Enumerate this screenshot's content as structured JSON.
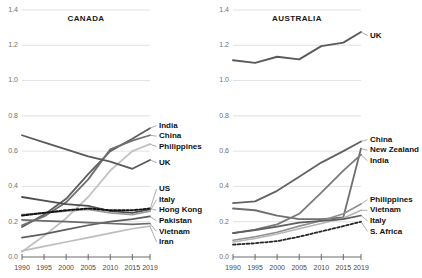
{
  "chart_data": [
    {
      "type": "line",
      "title": "CANADA",
      "xlabel": "",
      "ylabel": "",
      "x": [
        1990,
        1995,
        2000,
        2005,
        2010,
        2015,
        2019
      ],
      "xlim": [
        1990,
        2019
      ],
      "ylim": [
        0.0,
        1.4
      ],
      "xticks": [
        "1990",
        "1995",
        "2000",
        "2005",
        "2010",
        "2015",
        "2019"
      ],
      "yticks": [
        "0.0",
        "0.2",
        "0.4",
        "0.6",
        "0.8",
        "1.0",
        "1.2",
        "1.4"
      ],
      "grid": true,
      "legend_position": "right-inline-labels",
      "series": [
        {
          "name": "India",
          "values": [
            0.17,
            0.24,
            0.33,
            0.47,
            0.6,
            0.67,
            0.73
          ],
          "color": "#5e5e5e",
          "width": 1.8,
          "dash": "none"
        },
        {
          "name": "China",
          "values": [
            0.18,
            0.23,
            0.31,
            0.44,
            0.61,
            0.66,
            0.69
          ],
          "color": "#6f6f6f",
          "width": 1.8,
          "dash": "none"
        },
        {
          "name": "Philippines",
          "values": [
            0.03,
            0.12,
            0.22,
            0.34,
            0.49,
            0.6,
            0.64
          ],
          "color": "#c2c2c2",
          "width": 1.8,
          "dash": "none"
        },
        {
          "name": "UK",
          "values": [
            0.69,
            0.65,
            0.61,
            0.57,
            0.54,
            0.5,
            0.55
          ],
          "color": "#5a5a5a",
          "width": 1.8,
          "dash": "none"
        },
        {
          "name": "US",
          "values": [
            0.34,
            0.32,
            0.3,
            0.29,
            0.26,
            0.25,
            0.27
          ],
          "color": "#4f4f4f",
          "width": 1.8,
          "dash": "none"
        },
        {
          "name": "Italy",
          "values": [
            0.24,
            0.25,
            0.26,
            0.27,
            0.25,
            0.24,
            0.26
          ],
          "color": "#9a9a9a",
          "width": 1.6,
          "dash": "none"
        },
        {
          "name": "Hong Kong",
          "values": [
            0.235,
            0.25,
            0.265,
            0.275,
            0.265,
            0.265,
            0.275
          ],
          "color": "#111111",
          "width": 1.9,
          "dash": "2.4,1.8"
        },
        {
          "name": "Pakistan",
          "values": [
            0.11,
            0.13,
            0.155,
            0.18,
            0.2,
            0.215,
            0.23
          ],
          "color": "#5e5e5e",
          "width": 1.7,
          "dash": "none"
        },
        {
          "name": "Vietnam",
          "values": [
            0.21,
            0.205,
            0.2,
            0.195,
            0.19,
            0.185,
            0.19
          ],
          "color": "#6b6b6b",
          "width": 1.7,
          "dash": "none"
        },
        {
          "name": "Iran",
          "values": [
            0.035,
            0.06,
            0.085,
            0.11,
            0.135,
            0.16,
            0.175
          ],
          "color": "#bdbdbd",
          "width": 1.7,
          "dash": "none"
        }
      ],
      "labels": [
        {
          "name": "India",
          "y": 0.745
        },
        {
          "name": "China",
          "y": 0.685
        },
        {
          "name": "Philippines",
          "y": 0.625
        },
        {
          "name": "UK",
          "y": 0.535
        },
        {
          "name": "US",
          "y": 0.385
        },
        {
          "name": "Italy",
          "y": 0.325
        },
        {
          "name": "Hong Kong",
          "y": 0.265
        },
        {
          "name": "Pakistan",
          "y": 0.205
        },
        {
          "name": "Vietnam",
          "y": 0.145
        },
        {
          "name": "Iran",
          "y": 0.085
        }
      ]
    },
    {
      "type": "line",
      "title": "AUSTRALIA",
      "xlabel": "",
      "ylabel": "",
      "x": [
        1990,
        1995,
        2000,
        2005,
        2010,
        2015,
        2019
      ],
      "xlim": [
        1990,
        2019
      ],
      "ylim": [
        0.0,
        1.4
      ],
      "xticks": [
        "1990",
        "1995",
        "2000",
        "2005",
        "2010",
        "2015",
        "2019"
      ],
      "yticks": [
        "0.0",
        "0.2",
        "0.4",
        "0.6",
        "0.8",
        "1.0",
        "1.2",
        "1.4"
      ],
      "grid": true,
      "legend_position": "right-inline-labels",
      "series": [
        {
          "name": "UK",
          "values": [
            1.115,
            1.1,
            1.135,
            1.12,
            1.195,
            1.215,
            1.275
          ],
          "color": "#5a5a5a",
          "width": 1.9,
          "dash": "none"
        },
        {
          "name": "China",
          "values": [
            0.305,
            0.315,
            0.375,
            0.455,
            0.535,
            0.6,
            0.655
          ],
          "color": "#636363",
          "width": 1.8,
          "dash": "none"
        },
        {
          "name": "New Zealand",
          "values": [
            0.275,
            0.265,
            0.235,
            0.215,
            0.215,
            0.225,
            0.615
          ],
          "color": "#6f6f6f",
          "width": 1.8,
          "dash": "none"
        },
        {
          "name": "India",
          "values": [
            0.135,
            0.155,
            0.185,
            0.245,
            0.365,
            0.49,
            0.58
          ],
          "color": "#7a7a7a",
          "width": 1.8,
          "dash": "none"
        },
        {
          "name": "Philippines",
          "values": [
            0.095,
            0.115,
            0.14,
            0.175,
            0.205,
            0.245,
            0.3
          ],
          "color": "#8f8f8f",
          "width": 1.6,
          "dash": "none"
        },
        {
          "name": "Vietnam",
          "values": [
            0.085,
            0.105,
            0.13,
            0.16,
            0.19,
            0.22,
            0.265
          ],
          "color": "#b5b5b5",
          "width": 1.6,
          "dash": "none"
        },
        {
          "name": "Italy",
          "values": [
            0.135,
            0.152,
            0.172,
            0.195,
            0.205,
            0.215,
            0.235
          ],
          "color": "#5e5e5e",
          "width": 1.7,
          "dash": "none"
        },
        {
          "name": "S. Africa",
          "values": [
            0.07,
            0.078,
            0.09,
            0.115,
            0.145,
            0.175,
            0.2
          ],
          "color": "#262626",
          "width": 1.8,
          "dash": "2.6,2.0"
        }
      ],
      "labels": [
        {
          "name": "UK",
          "y": 1.255
        },
        {
          "name": "China",
          "y": 0.665
        },
        {
          "name": "New Zealand",
          "y": 0.605
        },
        {
          "name": "India",
          "y": 0.545
        },
        {
          "name": "Philippines",
          "y": 0.325
        },
        {
          "name": "Vietnam",
          "y": 0.265
        },
        {
          "name": "Italy",
          "y": 0.205
        },
        {
          "name": "S. Africa",
          "y": 0.145
        }
      ]
    }
  ]
}
